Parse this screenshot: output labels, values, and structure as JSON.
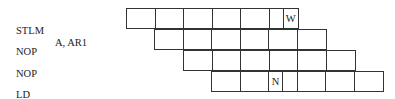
{
  "instructions": [
    {
      "op": "STLM",
      "operand": "A, AR1"
    },
    {
      "op": "NOP",
      "operand": ""
    },
    {
      "op": "NOP",
      "operand": ""
    },
    {
      "op": "LD",
      "operand": "*AR1, B"
    }
  ],
  "pipeline": {
    "cell_width": 28.6,
    "rows": [
      {
        "start_col": 0,
        "cells": 6,
        "marker": {
          "cell": 5,
          "half": "right",
          "label": "W"
        }
      },
      {
        "start_col": 1,
        "cells": 6,
        "marker": null
      },
      {
        "start_col": 2,
        "cells": 6,
        "marker": null
      },
      {
        "start_col": 3,
        "cells": 6,
        "marker": {
          "cell": 2,
          "half": "left",
          "label": "N"
        }
      }
    ]
  },
  "markers": {
    "w": "W",
    "n": "N"
  }
}
